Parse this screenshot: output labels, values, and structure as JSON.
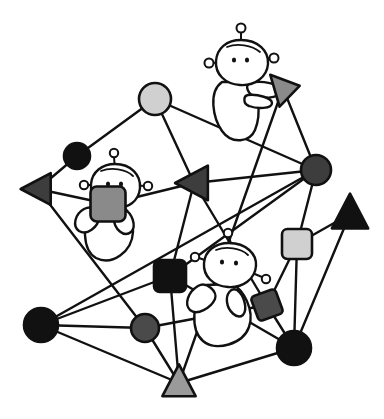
{
  "scene": {
    "title": "hand-drawn social network graph with alien characters",
    "background_color": "#ffffff",
    "width": 384,
    "height": 419,
    "line_color": "#111111"
  },
  "palette": {
    "black": "#111111",
    "dark_gray": "#3d3d3d",
    "mid_gray": "#6e6e6e",
    "light_gray": "#d0d0d0",
    "white": "#ffffff"
  },
  "nodes": [
    {
      "id": "n1",
      "name": "light-gray-circle-top",
      "shape": "circle",
      "fill": "#d0d0d0",
      "x": 155,
      "y": 99,
      "r": 16
    },
    {
      "id": "n2",
      "name": "black-circle-upper-left",
      "shape": "circle",
      "fill": "#111111",
      "x": 77,
      "y": 156,
      "r": 13
    },
    {
      "id": "n3",
      "name": "dark-gray-triangle-left",
      "shape": "triangle-left",
      "fill": "#3d3d3d",
      "x": 38,
      "y": 189,
      "size": 22
    },
    {
      "id": "n4",
      "name": "dark-gray-triangle-center",
      "shape": "triangle-left",
      "fill": "#3d3d3d",
      "x": 194,
      "y": 183,
      "size": 24
    },
    {
      "id": "n5",
      "name": "dark-gray-circle-hub-right",
      "shape": "circle",
      "fill": "#3d3d3d",
      "x": 316,
      "y": 170,
      "r": 15
    },
    {
      "id": "n6",
      "name": "gray-triangle-held-top",
      "shape": "triangle-right",
      "fill": "#8a8a8a",
      "x": 283,
      "y": 88,
      "size": 22
    },
    {
      "id": "n7",
      "name": "black-triangle-right-edge",
      "shape": "triangle-upright",
      "fill": "#111111",
      "x": 350,
      "y": 214,
      "size": 24
    },
    {
      "id": "n8",
      "name": "light-gray-square-right",
      "shape": "rounded-square",
      "fill": "#d0d0d0",
      "x": 297,
      "y": 244,
      "size": 30
    },
    {
      "id": "n9",
      "name": "black-square-center",
      "shape": "rounded-square",
      "fill": "#111111",
      "x": 170,
      "y": 276,
      "size": 32
    },
    {
      "id": "n10",
      "name": "dark-gray-diamond-right",
      "shape": "diamond-square",
      "fill": "#4a4a4a",
      "x": 267,
      "y": 305,
      "size": 26
    },
    {
      "id": "n11",
      "name": "black-circle-bottom-left",
      "shape": "circle",
      "fill": "#111111",
      "x": 41,
      "y": 325,
      "r": 17
    },
    {
      "id": "n12",
      "name": "mid-gray-circle-bottom",
      "shape": "circle",
      "fill": "#4a4a4a",
      "x": 145,
      "y": 328,
      "r": 14
    },
    {
      "id": "n13",
      "name": "black-circle-bottom-right",
      "shape": "circle",
      "fill": "#111111",
      "x": 294,
      "y": 348,
      "r": 17
    },
    {
      "id": "n14",
      "name": "gray-triangle-bottom",
      "shape": "triangle-upright",
      "fill": "#9a9a9a",
      "x": 179,
      "y": 383,
      "size": 22
    },
    {
      "id": "n15",
      "name": "gray-square-held-left-figure",
      "shape": "rounded-square",
      "fill": "#8a8a8a",
      "x": 108,
      "y": 204,
      "size": 35
    }
  ],
  "edges": [
    {
      "from": "n1",
      "to": "n2"
    },
    {
      "from": "n1",
      "to": "n5"
    },
    {
      "from": "n1",
      "to": "n4"
    },
    {
      "from": "n2",
      "to": "n3"
    },
    {
      "from": "n3",
      "to": "n15"
    },
    {
      "from": "n15",
      "to": "n4"
    },
    {
      "from": "n4",
      "to": "n5"
    },
    {
      "from": "n4",
      "to": "n9"
    },
    {
      "from": "n4",
      "to": "n10"
    },
    {
      "from": "n6",
      "to": "n5"
    },
    {
      "from": "n6",
      "to": "n14"
    },
    {
      "from": "n5",
      "to": "n8"
    },
    {
      "from": "n5",
      "to": "n9"
    },
    {
      "from": "n5",
      "to": "n11"
    },
    {
      "from": "n7",
      "to": "n8"
    },
    {
      "from": "n7",
      "to": "n13"
    },
    {
      "from": "n8",
      "to": "n10"
    },
    {
      "from": "n8",
      "to": "n13"
    },
    {
      "from": "n9",
      "to": "n14"
    },
    {
      "from": "n9",
      "to": "n11"
    },
    {
      "from": "n10",
      "to": "n12"
    },
    {
      "from": "n10",
      "to": "n13"
    },
    {
      "from": "n11",
      "to": "n12"
    },
    {
      "from": "n11",
      "to": "n14"
    },
    {
      "from": "n12",
      "to": "n14"
    },
    {
      "from": "n13",
      "to": "n14"
    },
    {
      "from": "n3",
      "to": "n12"
    },
    {
      "from": "n13",
      "to": "n9"
    }
  ],
  "figures": [
    {
      "id": "f1",
      "name": "alien-figure-top",
      "label": "alien character holding gray triangle",
      "head_x": 240,
      "head_y": 60,
      "antenna_count": 3
    },
    {
      "id": "f2",
      "name": "alien-figure-left",
      "label": "alien character holding gray square",
      "head_x": 115,
      "head_y": 184,
      "antenna_count": 3
    },
    {
      "id": "f3",
      "name": "alien-figure-center",
      "label": "alien character near dark gray diamond",
      "head_x": 229,
      "head_y": 266,
      "antenna_count": 3
    }
  ]
}
